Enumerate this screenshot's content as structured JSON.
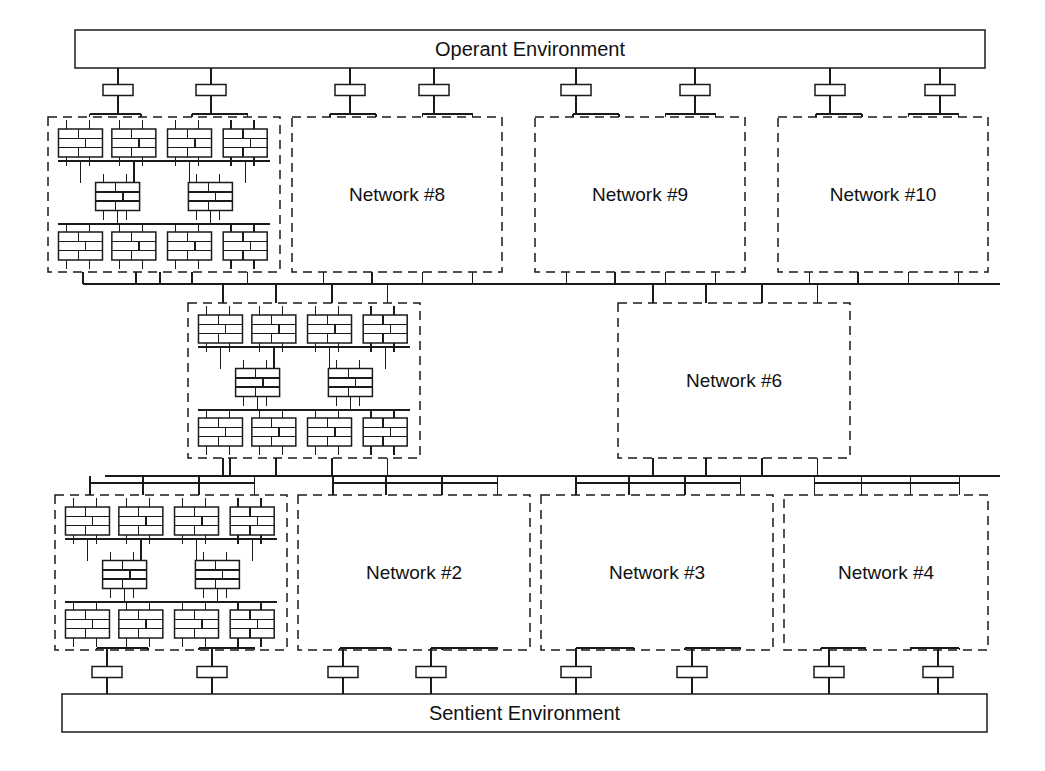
{
  "diagram": {
    "type": "block-diagram",
    "line_color": "#1a1a1a",
    "fill_color": "#ffffff",
    "background": "#ffffff"
  },
  "environments": {
    "top": {
      "label": "Operant Environment",
      "x": 75,
      "y": 30,
      "width": 910,
      "height": 38,
      "ports": [
        118,
        211,
        350,
        434,
        576,
        695,
        830,
        940
      ]
    },
    "bottom": {
      "label": "Sentient Environment",
      "x": 62,
      "y": 694,
      "width": 925,
      "height": 38,
      "ports": [
        107,
        212,
        343,
        431,
        576,
        692,
        829,
        938
      ]
    }
  },
  "networks": [
    {
      "id": "net7",
      "label": "",
      "detailed": true,
      "x": 48,
      "y": 117,
      "width": 232,
      "height": 155
    },
    {
      "id": "net8",
      "label": "Network #8",
      "detailed": false,
      "x": 292,
      "y": 117,
      "width": 210,
      "height": 155
    },
    {
      "id": "net9",
      "label": "Network #9",
      "detailed": false,
      "x": 535,
      "y": 117,
      "width": 210,
      "height": 155
    },
    {
      "id": "net10",
      "label": "Network #10",
      "detailed": false,
      "x": 778,
      "y": 117,
      "width": 210,
      "height": 155
    },
    {
      "id": "net5",
      "label": "",
      "detailed": true,
      "x": 188,
      "y": 303,
      "width": 232,
      "height": 155
    },
    {
      "id": "net6",
      "label": "Network #6",
      "detailed": false,
      "x": 618,
      "y": 303,
      "width": 232,
      "height": 155
    },
    {
      "id": "net1",
      "label": "",
      "detailed": true,
      "x": 55,
      "y": 495,
      "width": 232,
      "height": 155
    },
    {
      "id": "net2",
      "label": "Network #2",
      "detailed": false,
      "x": 298,
      "y": 495,
      "width": 232,
      "height": 155
    },
    {
      "id": "net3",
      "label": "Network #3",
      "detailed": false,
      "x": 541,
      "y": 495,
      "width": 232,
      "height": 155
    },
    {
      "id": "net4",
      "label": "Network #4",
      "detailed": false,
      "x": 784,
      "y": 495,
      "width": 204,
      "height": 155
    }
  ],
  "buses": [
    {
      "id": "upper-bus",
      "y": 284,
      "x1": 100,
      "x2": 1000
    },
    {
      "id": "lower-bus",
      "y": 476,
      "x1": 105,
      "x2": 1000
    }
  ],
  "legend": {
    "module_note": "neural module",
    "connector_note": "interface port"
  }
}
